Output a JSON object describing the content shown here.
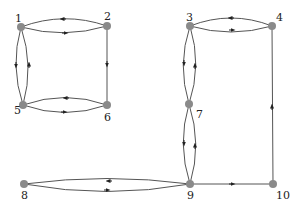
{
  "diagram": {
    "type": "directed-graph",
    "colors": {
      "node": "#8a8a8a",
      "edge": "#555555",
      "label": "#222222"
    },
    "nodes": [
      {
        "id": "1",
        "label": "1",
        "x": 21,
        "y": 27
      },
      {
        "id": "2",
        "label": "2",
        "x": 107,
        "y": 26
      },
      {
        "id": "3",
        "label": "3",
        "x": 190,
        "y": 26
      },
      {
        "id": "4",
        "label": "4",
        "x": 272,
        "y": 26
      },
      {
        "id": "5",
        "label": "5",
        "x": 23,
        "y": 105
      },
      {
        "id": "6",
        "label": "6",
        "x": 107,
        "y": 105
      },
      {
        "id": "7",
        "label": "7",
        "x": 189,
        "y": 104
      },
      {
        "id": "8",
        "label": "8",
        "x": 24,
        "y": 184
      },
      {
        "id": "9",
        "label": "9",
        "x": 190,
        "y": 184
      },
      {
        "id": "10",
        "label": "10",
        "x": 273,
        "y": 184
      }
    ],
    "edges": [
      {
        "from": "2",
        "to": "1"
      },
      {
        "from": "1",
        "to": "2"
      },
      {
        "from": "1",
        "to": "5"
      },
      {
        "from": "5",
        "to": "1"
      },
      {
        "from": "2",
        "to": "6"
      },
      {
        "from": "6",
        "to": "5"
      },
      {
        "from": "5",
        "to": "6"
      },
      {
        "from": "4",
        "to": "3"
      },
      {
        "from": "3",
        "to": "4"
      },
      {
        "from": "3",
        "to": "7"
      },
      {
        "from": "7",
        "to": "3"
      },
      {
        "from": "10",
        "to": "4"
      },
      {
        "from": "7",
        "to": "9"
      },
      {
        "from": "9",
        "to": "7"
      },
      {
        "from": "9",
        "to": "8"
      },
      {
        "from": "8",
        "to": "9"
      },
      {
        "from": "9",
        "to": "10"
      }
    ]
  }
}
